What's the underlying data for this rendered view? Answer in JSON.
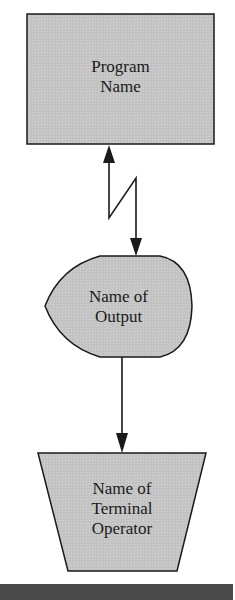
{
  "diagram": {
    "type": "flowchart",
    "colors": {
      "shape_fill": "#c6c6c6",
      "stroke": "#1a1a1a",
      "background": "#ffffff",
      "bottom_bar": "#4a4a4a"
    },
    "nodes": [
      {
        "id": "program",
        "shape": "process-rectangle",
        "lines": [
          "Program",
          "Name"
        ]
      },
      {
        "id": "output",
        "shape": "display",
        "lines": [
          "Name of",
          "Output"
        ]
      },
      {
        "id": "terminal",
        "shape": "manual-operation-trapezoid",
        "lines": [
          "Name of",
          "Terminal",
          "Operator"
        ]
      }
    ],
    "edges": [
      {
        "from": "program",
        "to": "output",
        "style": "communication-link-lightning",
        "bidirectional": true
      },
      {
        "from": "output",
        "to": "terminal",
        "style": "arrow",
        "bidirectional": false
      }
    ]
  }
}
